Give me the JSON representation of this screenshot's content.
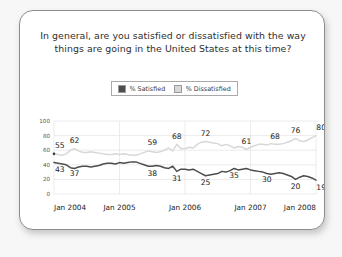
{
  "card": {
    "title": "In general, are you satisfied or dissatisfied with the way things are going in the United States at this time?",
    "title_line1": "In general, are you satisfied or dissatisfied with the way",
    "title_line2": "things are going in the United States at this time?"
  },
  "legend": {
    "entries": [
      {
        "label": "% Satisfied",
        "color": "#4d4d4d"
      },
      {
        "label": "% Dissatisfied",
        "color": "#d8d8d8"
      }
    ]
  },
  "chart_data": {
    "type": "line",
    "title": "In general, are you satisfied or dissatisfied with the way things are going in the United States at this time?",
    "xlabel": "",
    "ylabel": "",
    "ylim": [
      0,
      100
    ],
    "yticks": [
      0,
      20,
      40,
      60,
      80,
      100
    ],
    "ytick_labels": [
      "0",
      "20",
      "40",
      "60",
      "80",
      "100"
    ],
    "grid": true,
    "legend_position": "top-center",
    "xtick_labels": [
      "Jan 2004",
      "Jan 2005",
      "Jan 2006",
      "Jan 2007",
      "Jan 2008"
    ],
    "x_range": [
      "Jan 2004",
      "Jan 2008"
    ],
    "series": [
      {
        "name": "% Satisfied",
        "color": "#4d4d4d",
        "values": [
          43,
          42,
          41,
          40,
          36,
          35,
          37,
          38,
          38,
          37,
          38,
          39,
          41,
          42,
          42,
          41,
          43,
          42,
          43,
          44,
          44,
          42,
          40,
          38,
          38,
          39,
          38,
          36,
          35,
          38,
          31,
          34,
          34,
          33,
          34,
          31,
          28,
          25,
          26,
          27,
          28,
          31,
          30,
          32,
          35,
          33,
          34,
          35,
          33,
          32,
          31,
          30,
          28,
          27,
          28,
          29,
          28,
          26,
          24,
          20,
          23,
          25,
          24,
          22,
          19
        ],
        "labeled_points": [
          {
            "label": "43",
            "value": 43
          },
          {
            "label": "37",
            "value": 37
          },
          {
            "label": "38",
            "value": 38
          },
          {
            "label": "31",
            "value": 31
          },
          {
            "label": "25",
            "value": 25
          },
          {
            "label": "35",
            "value": 35
          },
          {
            "label": "30",
            "value": 30
          },
          {
            "label": "20",
            "value": 20
          },
          {
            "label": "19",
            "value": 19
          }
        ]
      },
      {
        "name": "% Dissatisfied",
        "color": "#d8d8d8",
        "values": [
          55,
          54,
          53,
          55,
          60,
          62,
          59,
          57,
          57,
          58,
          57,
          56,
          55,
          54,
          54,
          55,
          54,
          55,
          54,
          53,
          53,
          55,
          57,
          59,
          58,
          57,
          58,
          60,
          63,
          59,
          68,
          62,
          62,
          64,
          63,
          68,
          71,
          72,
          71,
          70,
          69,
          66,
          68,
          66,
          63,
          65,
          64,
          61,
          64,
          66,
          68,
          68,
          67,
          69,
          68,
          68,
          69,
          71,
          73,
          76,
          73,
          72,
          74,
          77,
          80
        ],
        "labeled_points": [
          {
            "label": "55",
            "value": 55
          },
          {
            "label": "62",
            "value": 62
          },
          {
            "label": "59",
            "value": 59
          },
          {
            "label": "68",
            "value": 68
          },
          {
            "label": "72",
            "value": 72
          },
          {
            "label": "61",
            "value": 61
          },
          {
            "label": "68",
            "value": 68
          },
          {
            "label": "76",
            "value": 76
          },
          {
            "label": "80",
            "value": 80
          }
        ]
      }
    ]
  }
}
